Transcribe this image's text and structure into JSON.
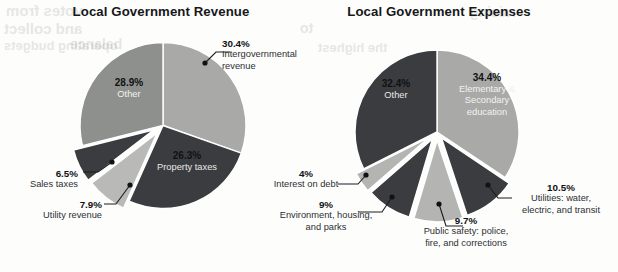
{
  "page": {
    "width": 618,
    "height": 272,
    "background": "#fdfdfc"
  },
  "bleed_through": [
    {
      "text": "votes from",
      "x": 6,
      "y": 2,
      "size": 15
    },
    {
      "text": "and collect",
      "x": 4,
      "y": 20,
      "size": 15
    },
    {
      "text": "balance",
      "x": 70,
      "y": 36,
      "size": 14
    },
    {
      "text": "operating budgets",
      "x": 4,
      "y": 38,
      "size": 13
    },
    {
      "text": "to",
      "x": 300,
      "y": 20,
      "size": 14
    },
    {
      "text": "the highest",
      "x": 318,
      "y": 40,
      "size": 13
    },
    {
      "text": "raising",
      "x": 470,
      "y": 4,
      "size": 14
    }
  ],
  "charts": [
    {
      "id": "local-government-revenue",
      "title": "Local Government Revenue",
      "title_box": {
        "x": 36,
        "y": 4,
        "width": 250
      },
      "geometry": {
        "cx": 163,
        "cy": 125.5,
        "r": 83,
        "start_angle_deg": 0
      },
      "chart_data": {
        "type": "pie",
        "title": "Local Government Revenue",
        "xlabel": "",
        "ylabel": "",
        "legend": "none",
        "grid": false,
        "categories": [
          "Intergovernmental revenue",
          "Property taxes",
          "Utility revenue",
          "Sales taxes",
          "Other"
        ],
        "values": [
          30.4,
          26.3,
          7.9,
          6.5,
          28.9
        ],
        "value_labels": [
          "30.4%",
          "26.3%",
          "7.9%",
          "6.5%",
          "28.9%"
        ],
        "units": "percent",
        "colors": [
          "#a9aaa7",
          "#3a3c3f",
          "#b9bab7",
          "#3a3c3f",
          "#8e908d"
        ],
        "exploded": [
          false,
          false,
          true,
          true,
          false
        ]
      },
      "slices": [
        {
          "name": "intergovernmental-revenue",
          "label": "Intergovernmental\nrevenue",
          "pct": "30.4%",
          "value": 30.4,
          "color": "#a9aaa7",
          "explode": 0
        },
        {
          "name": "property-taxes",
          "label": "Property taxes",
          "pct": "26.3%",
          "value": 26.3,
          "color": "#3a3c3f",
          "explode": 0
        },
        {
          "name": "utility-revenue",
          "label": "Utility revenue",
          "pct": "7.9%",
          "value": 7.9,
          "color": "#b9bab7",
          "explode": 9
        },
        {
          "name": "sales-taxes",
          "label": "Sales taxes",
          "pct": "6.5%",
          "value": 6.5,
          "color": "#3a3c3f",
          "explode": 10
        },
        {
          "name": "other",
          "label": "Other",
          "pct": "28.9%",
          "value": 28.9,
          "color": "#8e908d",
          "explode": 0
        }
      ],
      "inside_labels": [
        {
          "name": "other-inside-label",
          "pct": "28.9%",
          "text": "Other",
          "x": 90,
          "y": 77,
          "w": 78,
          "style": "dark"
        },
        {
          "name": "property-taxes-inside-label",
          "pct": "26.3%",
          "text": "Property taxes",
          "x": 139,
          "y": 150,
          "w": 96,
          "style": "onwhite"
        }
      ],
      "callouts": [
        {
          "name": "intergovernmental-revenue-callout",
          "pct": "30.4%",
          "lines": [
            "Intergovernmental",
            "revenue"
          ],
          "align": "left",
          "x": 222,
          "y": 38,
          "w": 96,
          "leader": {
            "dot": [
              205,
              63
            ],
            "path": "M205,63 L216,52 L230,52"
          }
        },
        {
          "name": "sales-taxes-callout",
          "pct": "6.5%",
          "lines": [
            "Sales taxes"
          ],
          "align": "right",
          "x": 2,
          "y": 168,
          "w": 76,
          "leader": {
            "dot": [
              112,
              162
            ],
            "path": "M112,162 L98,172 L83,172"
          }
        },
        {
          "name": "utility-revenue-callout",
          "pct": "7.9%",
          "lines": [
            "Utility revenue"
          ],
          "align": "right",
          "x": 10,
          "y": 199,
          "w": 92,
          "leader": {
            "dot": [
              130,
              185
            ],
            "path": "M130,185 L116,204 L104,204"
          }
        }
      ]
    },
    {
      "id": "local-government-expenses",
      "title": "Local Government Expenses",
      "title_box": {
        "x": 310,
        "y": 4,
        "width": 258
      },
      "geometry": {
        "cx": 437,
        "cy": 132,
        "r": 82,
        "start_angle_deg": 0
      },
      "chart_data": {
        "type": "pie",
        "title": "Local Government Expenses",
        "xlabel": "",
        "ylabel": "",
        "legend": "none",
        "grid": false,
        "categories": [
          "Elementary & Secondary education",
          "Utilities: water, electric, and transit",
          "Public safety: police, fire, and corrections",
          "Environment, housing, and parks",
          "Interest on debt",
          "Other"
        ],
        "values": [
          34.4,
          10.5,
          9.7,
          9.0,
          4.0,
          32.4
        ],
        "value_labels": [
          "34.4%",
          "10.5%",
          "9.7%",
          "9%",
          "4%",
          "32.4%"
        ],
        "units": "percent",
        "colors": [
          "#a9aaa7",
          "#3a3c3f",
          "#b4b5b2",
          "#3a3c3f",
          "#b4b5b2",
          "#3a3c3f"
        ],
        "exploded": [
          false,
          true,
          true,
          true,
          true,
          false
        ]
      },
      "slices": [
        {
          "name": "elementary-secondary-education",
          "label": "Elementary &\nSecondary\neducation",
          "pct": "34.4%",
          "value": 34.4,
          "color": "#a9aaa7",
          "explode": 0
        },
        {
          "name": "utilities",
          "label": "Utilities: water, electric, and transit",
          "pct": "10.5%",
          "value": 10.5,
          "color": "#3a3c3f",
          "explode": 7
        },
        {
          "name": "public-safety",
          "label": "Public safety: police, fire, and corrections",
          "pct": "9.7%",
          "value": 9.7,
          "color": "#b4b5b2",
          "explode": 8
        },
        {
          "name": "environment-housing-parks",
          "label": "Environment, housing, and parks",
          "pct": "9%",
          "value": 9.0,
          "color": "#3a3c3f",
          "explode": 8
        },
        {
          "name": "interest-on-debt",
          "label": "Interest on debt",
          "pct": "4%",
          "value": 4.0,
          "color": "#b4b5b2",
          "explode": 9
        },
        {
          "name": "other",
          "label": "Other",
          "pct": "32.4%",
          "value": 32.4,
          "color": "#3a3c3f",
          "explode": 0
        }
      ],
      "inside_labels": [
        {
          "name": "other-inside-label",
          "pct": "32.4%",
          "text": "Other",
          "x": 357,
          "y": 78,
          "w": 78,
          "style": "onwhite"
        },
        {
          "name": "education-inside-label",
          "pct": "34.4%",
          "text": "Elementary &\nSecondary\neducation",
          "x": 440,
          "y": 72,
          "w": 94,
          "style": "dark"
        }
      ],
      "callouts": [
        {
          "name": "interest-on-debt-callout",
          "pct": "4%",
          "lines": [
            "Interest on debt"
          ],
          "align": "center",
          "x": 258,
          "y": 168,
          "w": 96,
          "leader": {
            "dot": [
              366,
              175
            ],
            "path": "M366,175 L358,184 L338,184"
          }
        },
        {
          "name": "environment-housing-parks-callout",
          "pct": "9%",
          "lines": [
            "Environment, housing,",
            "and parks"
          ],
          "align": "center",
          "x": 264,
          "y": 199,
          "w": 124,
          "leader": {
            "dot": [
              392,
              197
            ],
            "path": "M392,197 L382,212 L358,212"
          }
        },
        {
          "name": "public-safety-callout",
          "pct": "9.7%",
          "lines": [
            "Public safety: police,",
            "fire, and corrections"
          ],
          "align": "center",
          "x": 404,
          "y": 215,
          "w": 124,
          "leader": {
            "dot": [
              439,
              204
            ],
            "path": "M439,204 L446,226 L463,226"
          }
        },
        {
          "name": "utilities-callout",
          "pct": "10.5%",
          "lines": [
            "Utilities: water,",
            "electric, and transit"
          ],
          "align": "center",
          "x": 504,
          "y": 182,
          "w": 114,
          "leader": {
            "dot": [
              488,
              185
            ],
            "path": "M488,185 L498,198 L512,198"
          }
        }
      ]
    }
  ]
}
